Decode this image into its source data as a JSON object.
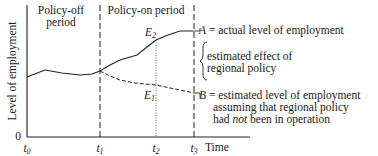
{
  "diagram": {
    "y_axis_label": "Level of employment",
    "y_origin_label": "0",
    "x_axis_label": "Time",
    "time_ticks": [
      {
        "base": "t",
        "sub": "0"
      },
      {
        "base": "t",
        "sub": "1"
      },
      {
        "base": "t",
        "sub": "2"
      },
      {
        "base": "t",
        "sub": "3"
      }
    ],
    "periods": {
      "policy_off_line1": "Policy-off",
      "policy_off_line2": "period",
      "policy_on": "Policy-on period"
    },
    "points": {
      "E2": {
        "base": "E",
        "sub": "2"
      },
      "E1": {
        "base": "E",
        "sub": "1"
      }
    },
    "legend": {
      "A_key": "A",
      "A_text": " = actual level of employment",
      "effect_line1": "estimated effect of",
      "effect_line2": "regional policy",
      "B_key": "B",
      "B_text_line1": " =  estimated level of employment",
      "B_text_line2": "assuming that regional policy",
      "B_text_line3_pre": "had ",
      "B_text_line3_em": "not",
      "B_text_line3_post": " been in operation"
    }
  }
}
